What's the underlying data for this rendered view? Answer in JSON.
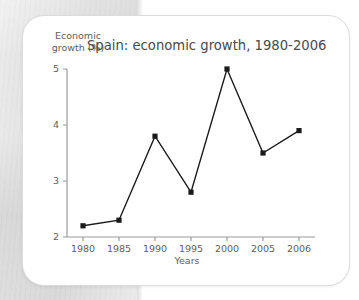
{
  "card": {
    "y_axis_title": "Economic\ngrowth (%)",
    "title": "Spain: economic growth, 1980-2006",
    "x_axis_title": "Years"
  },
  "chart_data": {
    "type": "line",
    "title": "Spain: economic growth, 1980-2006",
    "xlabel": "Years",
    "ylabel": "Economic growth (%)",
    "categories": [
      "1980",
      "1985",
      "1990",
      "1995",
      "2000",
      "2005",
      "2006"
    ],
    "values": [
      2.2,
      2.3,
      3.8,
      2.8,
      5.0,
      3.5,
      3.9
    ],
    "ylim": [
      2,
      5
    ],
    "y_ticks": [
      "2",
      "3",
      "4",
      "5"
    ],
    "y_tick_values": [
      2,
      3,
      4,
      5
    ],
    "x_ticks": [
      "1980",
      "1985",
      "1990",
      "1995",
      "2000",
      "2005",
      "2006"
    ],
    "grid": false,
    "legend": "none",
    "marker": "square",
    "line_color": "#1a1a1a",
    "marker_color": "#1a1a1a",
    "axis_color": "#9a9a9a",
    "text_color": "#5e5e5e",
    "background_color": "#ffffff"
  }
}
